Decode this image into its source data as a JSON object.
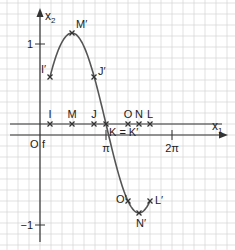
{
  "axes": {
    "x_label": "x",
    "x_sub": "1",
    "y_label": "x",
    "y_sub": "2",
    "origin_label": "O",
    "line_label": "f",
    "x_ticks": [
      {
        "label": "π",
        "x": 106
      },
      {
        "label": "2π",
        "x": 172
      }
    ],
    "y_ticks": [
      {
        "label": "1",
        "y": 44
      },
      {
        "label": "−1",
        "y": 225
      }
    ]
  },
  "line_points": [
    {
      "label": "I",
      "x": 50
    },
    {
      "label": "M",
      "x": 72
    },
    {
      "label": "J",
      "x": 94
    },
    {
      "label": "K = K′",
      "x": 106
    },
    {
      "label": "O",
      "x": 128
    },
    {
      "label": "N",
      "x": 139
    },
    {
      "label": "L",
      "x": 150
    }
  ],
  "curve_points": [
    {
      "label": "I′",
      "x": 50,
      "y": 77
    },
    {
      "label": "M′",
      "x": 72,
      "y": 33
    },
    {
      "label": "J′",
      "x": 94,
      "y": 77
    },
    {
      "label": "O′",
      "x": 128,
      "y": 201
    },
    {
      "label": "N′",
      "x": 139,
      "y": 213
    },
    {
      "label": "L′",
      "x": 150,
      "y": 201
    }
  ],
  "colors": {
    "grid": "#d4d4d4",
    "axis": "#333333",
    "curve": "#555555",
    "marker": "#333333"
  }
}
